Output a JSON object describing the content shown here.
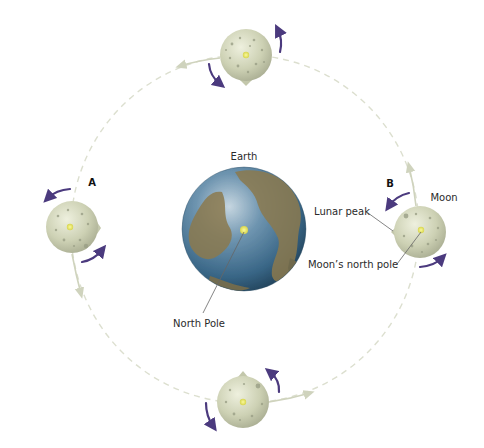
{
  "labels": {
    "earth": "Earth",
    "north_pole": "North Pole",
    "moon": "Moon",
    "lunar_peak": "Lunar peak",
    "moons_north_pole": "Moon’s north pole",
    "position_a": "A",
    "position_b": "B"
  },
  "colors": {
    "background": "#ffffff",
    "orbit": "#d9dccb",
    "rotation_arrow": "#4b3a7e",
    "moon_base": "#c9cdb0",
    "moon_light": "#e4e7d2",
    "moon_crater": "#9a9f86",
    "earth_ocean": "#3f6f90",
    "earth_land": "#8b7a4e",
    "pole_marker": "#e8e66a",
    "leader_line": "#555555"
  },
  "bodies": {
    "earth": {
      "cx": 244,
      "cy": 229,
      "r": 62
    },
    "moons": [
      {
        "id": "top",
        "cx": 246,
        "cy": 55,
        "r": 26
      },
      {
        "id": "A",
        "cx": 72,
        "cy": 227,
        "r": 26
      },
      {
        "id": "B",
        "cx": 420,
        "cy": 232,
        "r": 26
      },
      {
        "id": "bottom",
        "cx": 243,
        "cy": 402,
        "r": 26
      }
    ]
  }
}
